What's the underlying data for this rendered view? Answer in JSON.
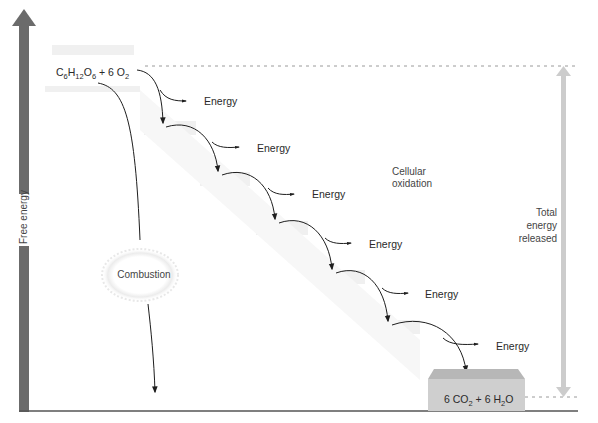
{
  "diagram": {
    "colors": {
      "axis": "#6b6b6b",
      "total_arrow": "#c9c9c9",
      "step_shadow": "#e6e6e6",
      "product_box": "#c8c8c8",
      "product_box_top": "#b5b5b5",
      "line": "#1e1e1e",
      "dashed": "#9a9a9a"
    },
    "y_axis": {
      "label": "Free energy"
    },
    "reactants": {
      "label": "C6H12O6 + 6 O2",
      "parts": [
        {
          "t": "C"
        },
        {
          "t": "6",
          "sub": true
        },
        {
          "t": "H"
        },
        {
          "t": "12",
          "sub": true
        },
        {
          "t": "O"
        },
        {
          "t": "6",
          "sub": true
        },
        {
          "t": " + 6 O"
        },
        {
          "t": "2",
          "sub": true
        }
      ]
    },
    "products": {
      "label": "6 CO2 + 6 H2O",
      "parts": [
        {
          "t": "6 CO"
        },
        {
          "t": "2",
          "sub": true
        },
        {
          "t": " + 6 H"
        },
        {
          "t": "2",
          "sub": true
        },
        {
          "t": "O"
        }
      ]
    },
    "pathways": {
      "combustion": {
        "label": "Combustion"
      },
      "cellular_oxidation": {
        "label_line1": "Cellular",
        "label_line2": "oxidation"
      }
    },
    "total_energy": {
      "line1": "Total",
      "line2": "energy",
      "line3": "released"
    },
    "energy_steps": [
      {
        "label": "Energy"
      },
      {
        "label": "Energy"
      },
      {
        "label": "Energy"
      },
      {
        "label": "Energy"
      },
      {
        "label": "Energy"
      },
      {
        "label": "Energy"
      }
    ]
  }
}
